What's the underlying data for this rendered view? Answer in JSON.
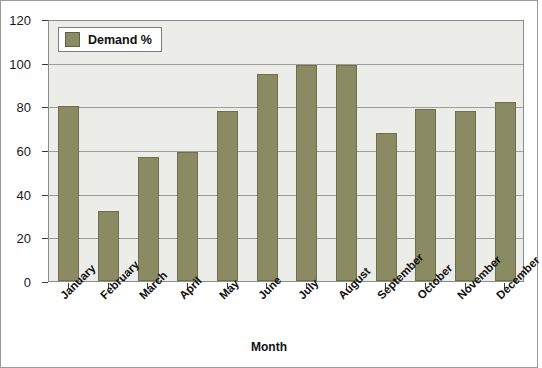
{
  "chart_data": {
    "type": "bar",
    "title": "",
    "xlabel": "Month",
    "ylabel": "",
    "ylim": [
      0,
      120
    ],
    "ytick_step": 20,
    "yticks": [
      0,
      20,
      40,
      60,
      80,
      100,
      120
    ],
    "grid": true,
    "legend_position": "top-left",
    "categories": [
      "January",
      "February",
      "March",
      "April",
      "May",
      "June",
      "July",
      "August",
      "September",
      "October",
      "November",
      "December"
    ],
    "series": [
      {
        "name": "Demand %",
        "color": "#8a8a63",
        "values": [
          80,
          32,
          57,
          59,
          78,
          95,
          99,
          99,
          68,
          79,
          78,
          82
        ]
      }
    ]
  },
  "legend": {
    "label": "Demand %",
    "swatch_color": "#8a8a63"
  },
  "axes": {
    "x_title": "Month",
    "plot_background": "#ecece9",
    "gridline_color": "#9d9d9d",
    "border_color": "#8c8c8c"
  }
}
